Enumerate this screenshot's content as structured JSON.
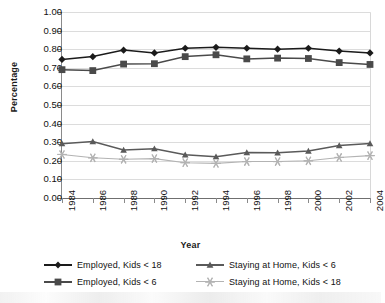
{
  "chart_data": {
    "type": "line",
    "title": "",
    "xlabel": "Year",
    "ylabel": "Percentage",
    "grid": true,
    "legend_position": "bottom",
    "xlim": [
      1984,
      2004
    ],
    "ylim": [
      0.0,
      1.0
    ],
    "ytick_step": 0.1,
    "categories": [
      1984,
      1986,
      1988,
      1990,
      1992,
      1994,
      1996,
      1998,
      2000,
      2002,
      2004
    ],
    "xtick_labels": [
      "1984",
      "1986",
      "1988",
      "1990",
      "1992",
      "1994",
      "1996",
      "1998",
      "2000",
      "2002",
      "2004"
    ],
    "ytick_labels": [
      "0.00",
      "0.10",
      "0.20",
      "0.30",
      "0.40",
      "0.50",
      "0.60",
      "0.70",
      "0.80",
      "0.90",
      "1.00"
    ],
    "series": [
      {
        "name": "Employed, Kids < 18",
        "marker": "diamond",
        "color": "#1b1b1b",
        "values": [
          0.745,
          0.76,
          0.795,
          0.78,
          0.805,
          0.81,
          0.805,
          0.8,
          0.805,
          0.79,
          0.78
        ]
      },
      {
        "name": "Employed, Kids < 6",
        "marker": "square",
        "color": "#4a4a4a",
        "values": [
          0.69,
          0.685,
          0.72,
          0.722,
          0.76,
          0.77,
          0.748,
          0.752,
          0.75,
          0.728,
          0.718
        ]
      },
      {
        "name": "Staying at Home, Kids < 6",
        "marker": "triangle",
        "color": "#5a5a5a",
        "values": [
          0.292,
          0.303,
          0.258,
          0.265,
          0.232,
          0.222,
          0.244,
          0.243,
          0.252,
          0.282,
          0.293
        ]
      },
      {
        "name": "Staying at Home, Kids < 18",
        "marker": "star",
        "color": "#b3b3b3",
        "values": [
          0.234,
          0.216,
          0.208,
          0.212,
          0.19,
          0.186,
          0.196,
          0.196,
          0.2,
          0.218,
          0.228
        ]
      }
    ]
  },
  "legend": {
    "rows": [
      [
        {
          "label": "Employed, Kids < 18",
          "marker": "diamond",
          "color": "#1b1b1b"
        },
        {
          "label": "Staying at Home, Kids < 6",
          "marker": "triangle",
          "color": "#5a5a5a"
        }
      ],
      [
        {
          "label": "Employed, Kids < 6",
          "marker": "square",
          "color": "#4a4a4a"
        },
        {
          "label": "Staying at Home, Kids < 18",
          "marker": "star",
          "color": "#b3b3b3"
        }
      ]
    ]
  }
}
